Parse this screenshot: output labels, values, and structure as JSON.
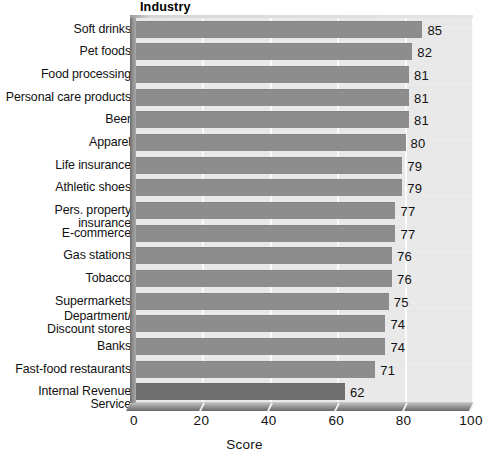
{
  "chart_data": {
    "type": "bar",
    "orientation": "horizontal",
    "title": "Industry",
    "xlabel": "Score",
    "ylabel": "",
    "xlim": [
      0,
      100
    ],
    "xticks": [
      0,
      20,
      40,
      60,
      80,
      100
    ],
    "xtick_labels": [
      "0",
      "20",
      "40",
      "60",
      "80",
      "100"
    ],
    "grid": true,
    "grid_axis": "x",
    "legend": null,
    "categories": [
      "Soft drinks",
      "Pet foods",
      "Food processing",
      "Personal care products",
      "Beer",
      "Apparel",
      "Life insurance",
      "Athletic shoes",
      "Pers. property insurance",
      "E-commerce",
      "Gas stations",
      "Tobacco",
      "Supermarkets",
      "Department/\nDiscount stores",
      "Banks",
      "Fast-food restaurants",
      "Internal Revenue Service"
    ],
    "values": [
      85,
      82,
      81,
      81,
      81,
      80,
      79,
      79,
      77,
      77,
      76,
      76,
      75,
      74,
      74,
      71,
      62
    ],
    "value_labels": [
      "85",
      "82",
      "81",
      "81",
      "81",
      "80",
      "79",
      "79",
      "77",
      "77",
      "76",
      "76",
      "75",
      "74",
      "74",
      "71",
      "62"
    ],
    "bar_color": "#8d8d8d",
    "last_bar_color": "#6f6f6f",
    "plot_background": "#e9e9e9",
    "gridline_color": "#fbfbfb"
  },
  "axis": {
    "x_title": "Score"
  }
}
